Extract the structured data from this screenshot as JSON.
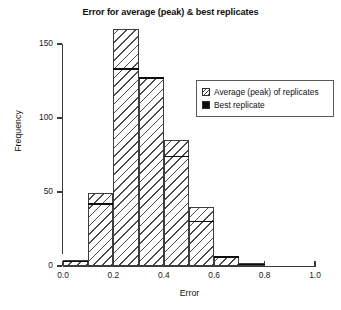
{
  "chart_data": {
    "type": "bar",
    "title": "Error for average (peak) & best replicates",
    "xlabel": "Error",
    "ylabel": "Frequency",
    "xlim": [
      0.0,
      1.0
    ],
    "ylim": [
      0,
      164
    ],
    "grid": false,
    "legend_position": "upper right",
    "bin_width": 0.1,
    "bin_edges": [
      0.0,
      0.1,
      0.2,
      0.3,
      0.4,
      0.5,
      0.6,
      0.7,
      0.8,
      0.9,
      1.0
    ],
    "categories": [
      "0.0-0.1",
      "0.1-0.2",
      "0.2-0.3",
      "0.3-0.4",
      "0.4-0.5",
      "0.5-0.6",
      "0.6-0.7",
      "0.7-0.8",
      "0.8-0.9",
      "0.9-1.0"
    ],
    "xticks": [
      "0.0",
      "0.2",
      "0.4",
      "0.6",
      "0.8",
      "1.0"
    ],
    "xtick_values": [
      0.0,
      0.2,
      0.4,
      0.6,
      0.8,
      1.0
    ],
    "yticks": [
      "0",
      "50",
      "100",
      "150"
    ],
    "ytick_values": [
      0,
      50,
      100,
      150
    ],
    "series": [
      {
        "name": "Average (peak) of replicates",
        "style": "hatched",
        "values": [
          4,
          49,
          160,
          128,
          85,
          40,
          7,
          2,
          0,
          0
        ]
      },
      {
        "name": "Best replicate",
        "style": "solid-black",
        "values": [
          3,
          42,
          133,
          127,
          74,
          30,
          6,
          1,
          0,
          0
        ]
      }
    ]
  },
  "figure": {
    "title": "Error for average (peak) & best replicates",
    "axes": {
      "x_label": "Error",
      "y_label": "Frequency"
    },
    "legend": {
      "items": [
        {
          "label": "Average (peak) of replicates",
          "swatch": "hatched-square-icon"
        },
        {
          "label": "Best replicate",
          "swatch": "black-square-icon"
        }
      ]
    }
  }
}
